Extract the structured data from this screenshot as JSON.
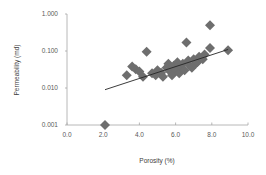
{
  "chart_data": {
    "type": "scatter",
    "title": "",
    "xlabel": "Porosity (%)",
    "ylabel": "Permeability (md)",
    "xlim": [
      0,
      10
    ],
    "ylim": [
      0.001,
      1
    ],
    "yscale": "log",
    "grid": false,
    "legend": null,
    "x_ticks": [
      "0.0",
      "2.0",
      "4.0",
      "6.0",
      "8.0",
      "10.0"
    ],
    "y_ticks": [
      "0.001",
      "0.010",
      "0.100",
      "1.000"
    ],
    "marker": "diamond",
    "marker_color": "#6e6e6e",
    "series": [
      {
        "name": "samples",
        "points": [
          [
            2.1,
            0.001
          ],
          [
            3.3,
            0.022
          ],
          [
            3.6,
            0.038
          ],
          [
            3.8,
            0.032
          ],
          [
            4.0,
            0.028
          ],
          [
            4.2,
            0.02
          ],
          [
            4.4,
            0.095
          ],
          [
            4.7,
            0.025
          ],
          [
            4.9,
            0.022
          ],
          [
            5.0,
            0.03
          ],
          [
            5.2,
            0.026
          ],
          [
            5.3,
            0.02
          ],
          [
            5.5,
            0.035
          ],
          [
            5.6,
            0.045
          ],
          [
            5.7,
            0.028
          ],
          [
            5.8,
            0.022
          ],
          [
            5.9,
            0.04
          ],
          [
            6.0,
            0.03
          ],
          [
            6.1,
            0.05
          ],
          [
            6.2,
            0.025
          ],
          [
            6.3,
            0.035
          ],
          [
            6.4,
            0.045
          ],
          [
            6.5,
            0.03
          ],
          [
            6.6,
            0.17
          ],
          [
            6.7,
            0.055
          ],
          [
            6.8,
            0.04
          ],
          [
            6.9,
            0.035
          ],
          [
            7.0,
            0.06
          ],
          [
            7.1,
            0.045
          ],
          [
            7.2,
            0.05
          ],
          [
            7.3,
            0.07
          ],
          [
            7.5,
            0.06
          ],
          [
            7.6,
            0.08
          ],
          [
            7.9,
            0.5
          ],
          [
            7.9,
            0.12
          ],
          [
            8.9,
            0.105
          ]
        ]
      }
    ],
    "trendline": {
      "type": "exponential",
      "from": [
        2.1,
        0.009
      ],
      "to": [
        8.9,
        0.11
      ],
      "color": "#262626"
    }
  }
}
